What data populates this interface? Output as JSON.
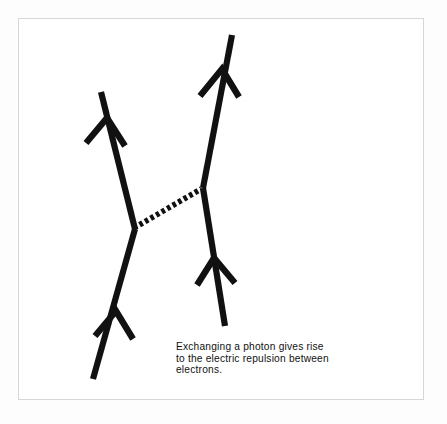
{
  "figure": {
    "kind": "feynman-diagram",
    "caption": "Exchanging a photon gives rise\nto the electric repulsion between\nelectrons.",
    "background_color": "#fdfdfd",
    "frame_color": "#d6d7d9",
    "ink_color": "#111111",
    "particles": {
      "electron_left": {
        "label": "electron-left-worldline",
        "direction": "upward",
        "arrowheads": 2
      },
      "electron_right": {
        "label": "electron-right-worldline",
        "direction": "upward",
        "arrowheads": 2
      },
      "photon": {
        "label": "photon-exchange-line",
        "style": "dotted",
        "dash_count": 15
      }
    }
  }
}
